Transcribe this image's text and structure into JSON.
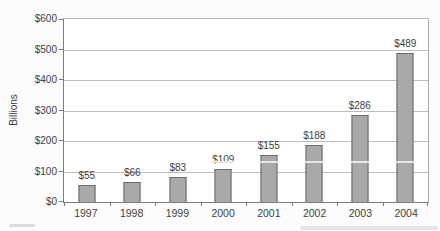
{
  "chart_data": {
    "type": "bar",
    "title": "",
    "categories": [
      "1997",
      "1998",
      "1999",
      "2000",
      "2001",
      "2002",
      "2003",
      "2004"
    ],
    "values": [
      55,
      66,
      83,
      109,
      155,
      188,
      286,
      489
    ],
    "bar_labels": [
      "$55",
      "$66",
      "$83",
      "$109",
      "$155",
      "$188",
      "$286",
      "$489"
    ],
    "xlabel": "",
    "ylabel": "Billions",
    "ylim": [
      0,
      600
    ],
    "ytick_step": 100,
    "ytick_labels": [
      "$0",
      "$100",
      "$200",
      "$300",
      "$400",
      "$500",
      "$600"
    ],
    "grid": "horizontal",
    "legend": "none",
    "colors": {
      "bar_fill": "#a9a9a9",
      "bar_border": "#6b6b6b",
      "gridline": "#bcbcbc",
      "axis": "#7c7c7c",
      "plot_border": "#ababab",
      "text": "#3c3c3c",
      "background": "#fcfcfc"
    }
  }
}
